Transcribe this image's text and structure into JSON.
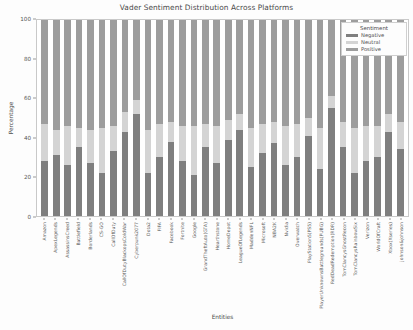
{
  "chart_data": {
    "type": "bar",
    "title": "Vader Sentiment Distribution Across Platforms",
    "xlabel": "Entities",
    "ylabel": "Percentage",
    "ylim": [
      0,
      100
    ],
    "yticks": [
      0,
      20,
      40,
      60,
      80,
      100
    ],
    "grid": false,
    "stacked": true,
    "stack_mode": "percent",
    "legend": {
      "title": "Sentiment",
      "position": "upper right",
      "entries": [
        "Negative",
        "Neutral",
        "Positive"
      ]
    },
    "colors": {
      "Negative": "#7f7f7f",
      "Neutral": "#d4d4d4",
      "Positive": "#9d9d9d"
    },
    "categories": [
      "Amazon",
      "ApexLegends",
      "AssassinsCreed",
      "Battlefield",
      "Borderlands",
      "CS-GO",
      "CallOfDuty",
      "CallOfDutyBlackopsColdWar",
      "Cyberpunk2077",
      "Dota2",
      "FIFA",
      "Facebook",
      "Fortnite",
      "Google",
      "GrandTheftAuto(GTA)",
      "Hearthstone",
      "HomeDepot",
      "LeagueOfLegends",
      "MaddenNFL",
      "Microsoft",
      "NBA2K",
      "Nvidia",
      "Overwatch",
      "PlayStation5(PS5)",
      "PlayerUnknownsBattlegrounds(PUBG)",
      "RedDeadRedemption(RDR)",
      "TomClancysGhostRecon",
      "TomClancysRainbowSix",
      "Verizon",
      "WorldOfCraft",
      "Xbox(Xseries)",
      "johnson&johnson"
    ],
    "series": [
      {
        "name": "Negative",
        "values": [
          28,
          31,
          26,
          35,
          27,
          22,
          33,
          43,
          52,
          22,
          30,
          38,
          28,
          21,
          35,
          27,
          39,
          44,
          25,
          32,
          37,
          26,
          30,
          41,
          24,
          55,
          35,
          22,
          28,
          30,
          43,
          34
        ]
      },
      {
        "name": "Neutral",
        "values": [
          19,
          13,
          20,
          10,
          17,
          23,
          13,
          10,
          7,
          22,
          17,
          10,
          18,
          25,
          12,
          19,
          10,
          8,
          20,
          15,
          11,
          20,
          17,
          9,
          21,
          6,
          13,
          23,
          18,
          16,
          9,
          14
        ]
      },
      {
        "name": "Positive",
        "values": [
          53,
          56,
          54,
          55,
          56,
          55,
          54,
          47,
          41,
          56,
          53,
          52,
          54,
          54,
          53,
          54,
          51,
          48,
          55,
          53,
          52,
          54,
          53,
          50,
          55,
          39,
          52,
          55,
          54,
          54,
          48,
          52
        ]
      }
    ]
  }
}
